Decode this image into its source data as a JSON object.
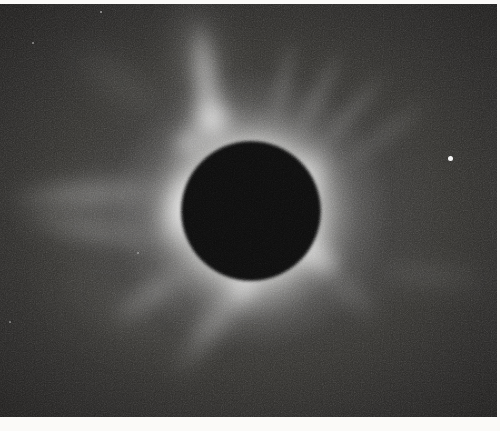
{
  "meta": {
    "type": "black-and-white film photograph on white paper"
  },
  "palette": {
    "paper": "#fbfaf8",
    "sky_corner": "#181716",
    "sky_outer": "#1e1d1c",
    "sky_dark": "#282726",
    "sky_mid": "#33322f",
    "sky_light": "#3e3d3c",
    "sky_inner": "#4c4b4a",
    "moon_disk": "#0c0c0c",
    "corona": "#ffffff"
  },
  "photo": {
    "left": 0,
    "top": 4,
    "width": 497,
    "height": 413
  },
  "moon_disk": {
    "cx": 251,
    "cy": 207,
    "r": 70
  },
  "inner_corona": {
    "cx": 251,
    "cy": 207,
    "size": 360
  },
  "streamers": [
    {
      "name": "top-streamer-halo",
      "cx": 200,
      "cy": 62,
      "w": 96,
      "h": 210,
      "rot": -7,
      "alpha": 0.16,
      "blur": 13
    },
    {
      "name": "top-streamer-core",
      "cx": 206,
      "cy": 78,
      "w": 44,
      "h": 175,
      "rot": -7,
      "alpha": 0.5,
      "blur": 7
    },
    {
      "name": "top-streamer-base",
      "cx": 212,
      "cy": 115,
      "w": 66,
      "h": 68,
      "rot": -10,
      "alpha": 0.8,
      "blur": 9
    },
    {
      "name": "upper-left-blob",
      "cx": 190,
      "cy": 138,
      "w": 54,
      "h": 48,
      "rot": -35,
      "alpha": 0.6,
      "blur": 9
    },
    {
      "name": "left-crescent",
      "cx": 181,
      "cy": 203,
      "w": 58,
      "h": 115,
      "rot": 12,
      "alpha": 0.7,
      "blur": 9
    },
    {
      "name": "left-ray-upper",
      "cx": 88,
      "cy": 190,
      "w": 230,
      "h": 46,
      "rot": -4,
      "alpha": 0.26,
      "blur": 9
    },
    {
      "name": "left-ray-lower",
      "cx": 92,
      "cy": 226,
      "w": 210,
      "h": 40,
      "rot": 9,
      "alpha": 0.2,
      "blur": 9
    },
    {
      "name": "left-fan-soft",
      "cx": 115,
      "cy": 207,
      "w": 260,
      "h": 130,
      "rot": 4,
      "alpha": 0.1,
      "blur": 15
    },
    {
      "name": "upper-left-diagonal",
      "cx": 120,
      "cy": 78,
      "w": 175,
      "h": 55,
      "rot": 33,
      "alpha": 0.09,
      "blur": 13
    },
    {
      "name": "lower-left-streamer",
      "cx": 152,
      "cy": 290,
      "w": 140,
      "h": 40,
      "rot": -35,
      "alpha": 0.28,
      "blur": 9
    },
    {
      "name": "bottom-streamer-base",
      "cx": 243,
      "cy": 284,
      "w": 50,
      "h": 58,
      "rot": 25,
      "alpha": 0.5,
      "blur": 8
    },
    {
      "name": "bottom-streamer",
      "cx": 217,
      "cy": 315,
      "w": 130,
      "h": 44,
      "rot": -50,
      "alpha": 0.34,
      "blur": 9
    },
    {
      "name": "bottom-streamer-tail",
      "cx": 192,
      "cy": 348,
      "w": 90,
      "h": 34,
      "rot": -50,
      "alpha": 0.15,
      "blur": 10
    },
    {
      "name": "bottom-right-streamer-base",
      "cx": 321,
      "cy": 256,
      "w": 66,
      "h": 46,
      "rot": 38,
      "alpha": 0.55,
      "blur": 8
    },
    {
      "name": "bottom-right-streamer",
      "cx": 352,
      "cy": 290,
      "w": 95,
      "h": 34,
      "rot": 41,
      "alpha": 0.22,
      "blur": 10
    },
    {
      "name": "right-horizontal-ray",
      "cx": 428,
      "cy": 272,
      "w": 190,
      "h": 34,
      "rot": 4,
      "alpha": 0.12,
      "blur": 11
    },
    {
      "name": "right-rim-upper",
      "cx": 309,
      "cy": 172,
      "w": 52,
      "h": 86,
      "rot": 22,
      "alpha": 0.45,
      "blur": 9
    },
    {
      "name": "right-rim-lower",
      "cx": 307,
      "cy": 240,
      "w": 58,
      "h": 58,
      "rot": -20,
      "alpha": 0.38,
      "blur": 9
    },
    {
      "name": "upper-right-wisp-1",
      "cx": 283,
      "cy": 80,
      "w": 140,
      "h": 22,
      "rot": -77,
      "alpha": 0.2,
      "blur": 7
    },
    {
      "name": "upper-right-wisp-2",
      "cx": 318,
      "cy": 92,
      "w": 150,
      "h": 24,
      "rot": -63,
      "alpha": 0.2,
      "blur": 7
    },
    {
      "name": "upper-right-wisp-3",
      "cx": 350,
      "cy": 110,
      "w": 160,
      "h": 24,
      "rot": -49,
      "alpha": 0.18,
      "blur": 7
    },
    {
      "name": "upper-right-wisp-4",
      "cx": 383,
      "cy": 132,
      "w": 170,
      "h": 26,
      "rot": -37,
      "alpha": 0.14,
      "blur": 8
    },
    {
      "name": "below-disk-glow",
      "cx": 250,
      "cy": 292,
      "w": 150,
      "h": 70,
      "rot": 0,
      "alpha": 0.14,
      "blur": 13
    },
    {
      "name": "lower-left-soft-fan",
      "cx": 120,
      "cy": 300,
      "w": 250,
      "h": 130,
      "rot": 28,
      "alpha": 0.06,
      "blur": 16
    }
  ],
  "stars": [
    {
      "name": "star",
      "x": 450,
      "y": 154,
      "r": 2.5,
      "alpha": 0.95
    },
    {
      "name": "dust-speck",
      "x": 101,
      "y": 8,
      "r": 1.3,
      "alpha": 0.5
    },
    {
      "name": "dust-speck",
      "x": 33,
      "y": 39,
      "r": 1.3,
      "alpha": 0.45
    },
    {
      "name": "dust-speck",
      "x": 10,
      "y": 318,
      "r": 1.2,
      "alpha": 0.4
    },
    {
      "name": "dust-speck",
      "x": 138,
      "y": 249,
      "r": 1.1,
      "alpha": 0.38
    }
  ]
}
